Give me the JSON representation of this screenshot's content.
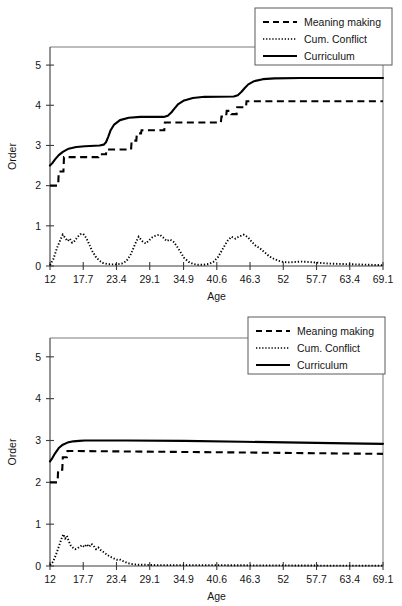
{
  "chart_data": [
    {
      "id": "top",
      "type": "line",
      "title": "",
      "xlabel": "Age",
      "ylabel": "Order",
      "xlim": [
        12,
        69.1
      ],
      "ylim": [
        0,
        5.45
      ],
      "grid": false,
      "legend_position": "top-right",
      "xticks": [
        "12",
        "17.7",
        "23.4",
        "29.1",
        "34.9",
        "40.6",
        "46.3",
        "52",
        "57.7",
        "63.4",
        "69.1"
      ],
      "xtick_values": [
        12,
        17.7,
        23.4,
        29.1,
        34.9,
        40.6,
        46.3,
        52,
        57.7,
        63.4,
        69.1
      ],
      "yticks": [
        "0",
        "1",
        "2",
        "3",
        "4",
        "5"
      ],
      "ytick_values": [
        0,
        1,
        2,
        3,
        4,
        5
      ],
      "series": [
        {
          "name": "Meaning making",
          "style": "dashed",
          "x": [
            12.0,
            13.4,
            13.5,
            14.3,
            14.4,
            20.3,
            20.4,
            21.6,
            21.7,
            25.9,
            26.0,
            26.8,
            26.9,
            27.6,
            27.7,
            31.6,
            31.7,
            41.3,
            41.4,
            42.2,
            42.3,
            43.0,
            43.1,
            44.0,
            44.1,
            45.6,
            45.7,
            69.1
          ],
          "y": [
            2.0,
            2.0,
            2.35,
            2.35,
            2.71,
            2.71,
            2.78,
            2.78,
            2.9,
            2.9,
            3.12,
            3.12,
            3.3,
            3.3,
            3.38,
            3.38,
            3.57,
            3.57,
            3.72,
            3.72,
            3.86,
            3.86,
            3.78,
            3.78,
            3.95,
            3.95,
            4.1,
            4.1
          ]
        },
        {
          "name": "Cum. Conflict",
          "style": "dotted",
          "comment": "three attenuating oscillation bursts near the baseline, peak height about 0.8",
          "x": [
            12.0,
            12.6,
            13.2,
            13.8,
            14.2,
            14.6,
            15.0,
            15.4,
            15.8,
            16.2,
            16.7,
            17.2,
            17.7,
            18.2,
            18.7,
            19.2,
            19.8,
            20.4,
            21.0,
            21.8,
            22.6,
            23.4,
            24.3,
            25.1,
            25.9,
            26.6,
            27.2,
            27.8,
            28.4,
            29.0,
            29.6,
            30.2,
            30.8,
            31.4,
            32.0,
            32.6,
            33.2,
            33.8,
            34.4,
            35.0,
            35.8,
            36.6,
            37.4,
            38.3,
            39.2,
            40.0,
            40.8,
            41.6,
            42.4,
            43.1,
            43.8,
            44.5,
            45.2,
            45.9,
            46.6,
            47.3,
            48.0,
            48.8,
            49.6,
            50.4,
            51.2,
            52.0,
            53.0,
            54.0,
            55.0,
            56.5,
            58.0,
            60.0,
            62.0,
            64.5,
            67.0,
            69.1
          ],
          "y": [
            0.02,
            0.18,
            0.45,
            0.66,
            0.78,
            0.7,
            0.62,
            0.68,
            0.58,
            0.62,
            0.72,
            0.79,
            0.8,
            0.7,
            0.55,
            0.38,
            0.24,
            0.14,
            0.08,
            0.05,
            0.04,
            0.04,
            0.06,
            0.12,
            0.3,
            0.55,
            0.73,
            0.62,
            0.56,
            0.64,
            0.72,
            0.76,
            0.78,
            0.71,
            0.62,
            0.66,
            0.6,
            0.48,
            0.34,
            0.2,
            0.1,
            0.05,
            0.03,
            0.03,
            0.05,
            0.1,
            0.22,
            0.42,
            0.62,
            0.73,
            0.68,
            0.74,
            0.78,
            0.72,
            0.6,
            0.5,
            0.44,
            0.34,
            0.24,
            0.18,
            0.13,
            0.1,
            0.09,
            0.1,
            0.11,
            0.1,
            0.08,
            0.06,
            0.05,
            0.04,
            0.03,
            0.02
          ]
        },
        {
          "name": "Curriculum",
          "style": "solid",
          "x": [
            12.0,
            12.4,
            12.9,
            13.5,
            14.2,
            15.2,
            16.5,
            18.0,
            20.5,
            21.2,
            21.6,
            22.0,
            22.4,
            23.0,
            24.0,
            25.5,
            27.5,
            31.5,
            32.2,
            32.8,
            33.4,
            34.0,
            35.0,
            36.5,
            38.5,
            43.5,
            44.2,
            44.8,
            45.4,
            46.0,
            47.0,
            48.5,
            50.5,
            55.0,
            69.1
          ],
          "y": [
            2.5,
            2.56,
            2.66,
            2.76,
            2.84,
            2.92,
            2.96,
            2.98,
            3.0,
            3.02,
            3.08,
            3.22,
            3.38,
            3.52,
            3.63,
            3.69,
            3.71,
            3.71,
            3.74,
            3.82,
            3.93,
            4.03,
            4.12,
            4.18,
            4.21,
            4.22,
            4.25,
            4.33,
            4.43,
            4.52,
            4.6,
            4.65,
            4.67,
            4.68,
            4.68
          ]
        }
      ]
    },
    {
      "id": "bottom",
      "type": "line",
      "title": "",
      "xlabel": "Age",
      "ylabel": "Order",
      "xlim": [
        12,
        69.1
      ],
      "ylim": [
        0,
        5.45
      ],
      "grid": false,
      "legend_position": "top-right",
      "xticks": [
        "12",
        "17.7",
        "23.4",
        "29.1",
        "34.9",
        "40.6",
        "46.3",
        "52",
        "57.7",
        "63.4",
        "69.1"
      ],
      "xtick_values": [
        12,
        17.7,
        23.4,
        29.1,
        34.9,
        40.6,
        46.3,
        52,
        57.7,
        63.4,
        69.1
      ],
      "yticks": [
        "0",
        "1",
        "2",
        "3",
        "4",
        "5"
      ],
      "ytick_values": [
        0,
        1,
        2,
        3,
        4,
        5
      ],
      "series": [
        {
          "name": "Meaning making",
          "style": "dashed",
          "x": [
            12.0,
            13.3,
            13.4,
            14.1,
            14.2,
            14.9,
            15.0,
            40.0,
            69.1
          ],
          "y": [
            2.0,
            2.0,
            2.3,
            2.3,
            2.6,
            2.6,
            2.75,
            2.72,
            2.68
          ]
        },
        {
          "name": "Cum. Conflict",
          "style": "dotted",
          "comment": "single damped burst decaying to zero by about age 27",
          "x": [
            12.0,
            12.5,
            13.0,
            13.5,
            14.0,
            14.3,
            14.6,
            14.9,
            15.2,
            15.5,
            15.9,
            16.3,
            16.7,
            17.1,
            17.5,
            17.9,
            18.3,
            18.7,
            19.1,
            19.5,
            19.9,
            20.3,
            20.7,
            21.1,
            21.5,
            21.9,
            22.3,
            22.7,
            23.1,
            23.5,
            23.9,
            24.3,
            24.8,
            25.3,
            25.9,
            26.5,
            27.2,
            28.0,
            29.0,
            30.5,
            32.5,
            35.0,
            38.0,
            42.0,
            47.0,
            52.0,
            58.0,
            63.0,
            69.1
          ],
          "y": [
            0.02,
            0.1,
            0.26,
            0.46,
            0.66,
            0.76,
            0.66,
            0.72,
            0.6,
            0.5,
            0.44,
            0.4,
            0.42,
            0.46,
            0.5,
            0.45,
            0.52,
            0.46,
            0.53,
            0.48,
            0.4,
            0.44,
            0.38,
            0.34,
            0.3,
            0.26,
            0.22,
            0.2,
            0.17,
            0.15,
            0.16,
            0.13,
            0.1,
            0.07,
            0.05,
            0.04,
            0.03,
            0.03,
            0.025,
            0.02,
            0.02,
            0.02,
            0.02,
            0.02,
            0.015,
            0.015,
            0.01,
            0.01,
            0.01
          ]
        },
        {
          "name": "Curriculum",
          "style": "solid",
          "x": [
            12.0,
            12.4,
            12.9,
            13.5,
            14.2,
            15.0,
            16.0,
            17.0,
            18.0,
            20.0,
            25.0,
            35.0,
            45.0,
            55.0,
            63.0,
            69.1
          ],
          "y": [
            2.5,
            2.58,
            2.7,
            2.82,
            2.9,
            2.95,
            2.98,
            2.99,
            3.0,
            3.0,
            3.0,
            2.99,
            2.97,
            2.95,
            2.93,
            2.92
          ]
        }
      ]
    }
  ],
  "legend": {
    "items": [
      {
        "label": "Meaning making",
        "style": "dashed"
      },
      {
        "label": "Cum. Conflict",
        "style": "dotted"
      },
      {
        "label": "Curriculum",
        "style": "solid"
      }
    ]
  }
}
